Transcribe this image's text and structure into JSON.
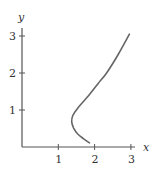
{
  "chart_data": {
    "type": "line",
    "title": "",
    "xlabel": "x",
    "ylabel": "y",
    "xlim": [
      0,
      3.3
    ],
    "ylim": [
      0,
      3.2
    ],
    "x_ticks": [
      "1",
      "2",
      "3"
    ],
    "y_ticks": [
      "1",
      "2",
      "3"
    ],
    "grid": false,
    "legend": null,
    "series": [
      {
        "name": "curve",
        "color": "#666666",
        "x": [
          1.86,
          1.7,
          1.53,
          1.42,
          1.37,
          1.4,
          1.55,
          1.86,
          2.1,
          2.33,
          2.65,
          2.96
        ],
        "y": [
          0.11,
          0.22,
          0.36,
          0.52,
          0.68,
          0.85,
          1.07,
          1.42,
          1.72,
          2.0,
          2.5,
          3.05
        ]
      }
    ]
  },
  "axes": {
    "x_label": "x",
    "y_label": "y",
    "x_tick_labels": [
      "1",
      "2",
      "3"
    ],
    "y_tick_labels": [
      "1",
      "2",
      "3"
    ]
  }
}
